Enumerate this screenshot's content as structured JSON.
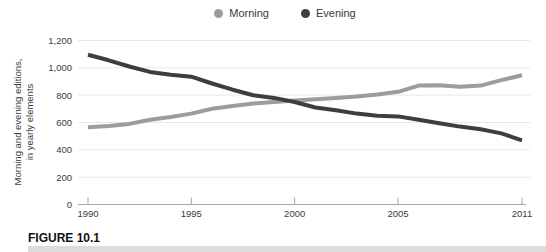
{
  "legend": {
    "items": [
      {
        "label": "Morning",
        "color": "#9c9c9c"
      },
      {
        "label": "Evening",
        "color": "#3e3e42"
      }
    ]
  },
  "figure_label": "FIGURE 10.1",
  "colors": {
    "grid": "#e8e8e8",
    "axis": "#a5a5a5",
    "tick_text": "#3b3b3b",
    "morning": "#9c9c9c",
    "evening": "#3e3e42"
  },
  "chart_data": {
    "type": "line",
    "title": "",
    "ylabel_lines": [
      "Morning and evening editions,",
      "in yearly elements"
    ],
    "xlabel": "",
    "x": [
      1990,
      1991,
      1992,
      1993,
      1994,
      1995,
      1996,
      1997,
      1998,
      1999,
      2000,
      2001,
      2002,
      2003,
      2004,
      2005,
      2006,
      2007,
      2008,
      2009,
      2010,
      2011
    ],
    "series": [
      {
        "name": "Morning",
        "color": "#9c9c9c",
        "values": [
          565,
          575,
          590,
          620,
          640,
          665,
          700,
          720,
          740,
          750,
          760,
          770,
          780,
          790,
          805,
          825,
          870,
          872,
          862,
          870,
          910,
          945
        ]
      },
      {
        "name": "Evening",
        "color": "#3e3e42",
        "values": [
          1095,
          1055,
          1010,
          970,
          950,
          935,
          885,
          840,
          800,
          780,
          750,
          710,
          690,
          665,
          650,
          645,
          620,
          595,
          570,
          550,
          520,
          470
        ]
      }
    ],
    "ylim": [
      0,
      1200
    ],
    "yticks": [
      0,
      200,
      400,
      600,
      800,
      1000,
      1200
    ],
    "ytick_labels": [
      "0",
      "200",
      "400",
      "600",
      "800",
      "1,000",
      "1,200"
    ],
    "xticks": [
      1990,
      1995,
      2000,
      2005,
      2011
    ],
    "xtick_labels": [
      "1990",
      "1995",
      "2000",
      "2005",
      "2011"
    ],
    "grid": true,
    "legend_position": "top-center"
  }
}
